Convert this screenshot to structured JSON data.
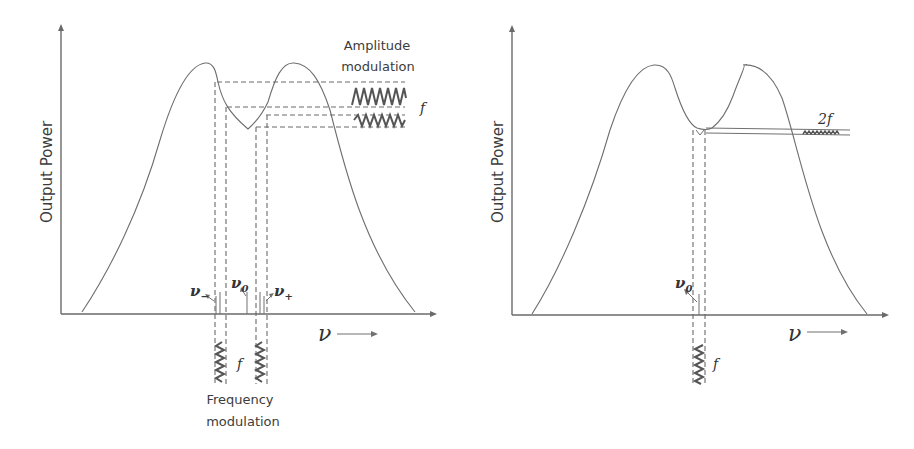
{
  "panels": [
    {
      "id": "left",
      "y_axis_label": "Output Power",
      "x_axis_label": "ν",
      "amplitude_label_line1": "Amplitude",
      "amplitude_label_line2": "modulation",
      "amplitude_freq_label": "f",
      "frequency_label_line1": "Frequency",
      "frequency_label_line2": "modulation",
      "frequency_freq_label": "f",
      "nu_minus": "ν",
      "nu_minus_sub": "−",
      "nu_zero": "ν",
      "nu_zero_sub": "0",
      "nu_plus": "ν",
      "nu_plus_sub": "+"
    },
    {
      "id": "right",
      "y_axis_label": "Output Power",
      "x_axis_label": "ν",
      "harmonic_label": "2f",
      "frequency_freq_label": "f",
      "nu_zero": "ν",
      "nu_zero_sub": "0"
    }
  ],
  "colors": {
    "line": "#6e6e6e",
    "wave": "#555555",
    "text": "#3c3c3c"
  }
}
